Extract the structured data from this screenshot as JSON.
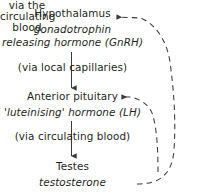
{
  "diagram": {
    "title_text": "",
    "background_color": "#ffffff",
    "ink_color": "#231f20",
    "nodes": {
      "hypothalamus": {
        "name": "Hypothalamus",
        "hormone_line_1": "gonadotrophin",
        "hormone_line_2": "releasing hormone (GnRH)"
      },
      "anterior_pituitary": {
        "name": "Anterior pituitary",
        "hormone_line_1": "'luteinising' hormone (LH)"
      },
      "testes": {
        "name": "Testes",
        "hormone_line_1": "testosterone"
      }
    },
    "transport_labels": {
      "hypothalamus_to_pituitary": "(via local capillaries)",
      "pituitary_to_testes": "(via circulating blood)",
      "feedback_line_1": "via the",
      "feedback_line_2": "circulating",
      "feedback_line_3": "blood"
    },
    "edges": [
      {
        "id": "arrow-hypothalamus-to-pituitary",
        "style": "solid",
        "direction": "down",
        "from": "hypothalamus",
        "to": "anterior_pituitary"
      },
      {
        "id": "arrow-pituitary-to-testes",
        "style": "solid",
        "direction": "down",
        "from": "anterior_pituitary",
        "to": "testes"
      },
      {
        "id": "arrow-feedback-to-hypothalamus",
        "style": "dashed",
        "direction": "left",
        "from": "testes",
        "to": "hypothalamus"
      },
      {
        "id": "arrow-feedback-to-pituitary",
        "style": "dashed",
        "direction": "left",
        "from": "testes",
        "to": "anterior_pituitary"
      }
    ]
  }
}
